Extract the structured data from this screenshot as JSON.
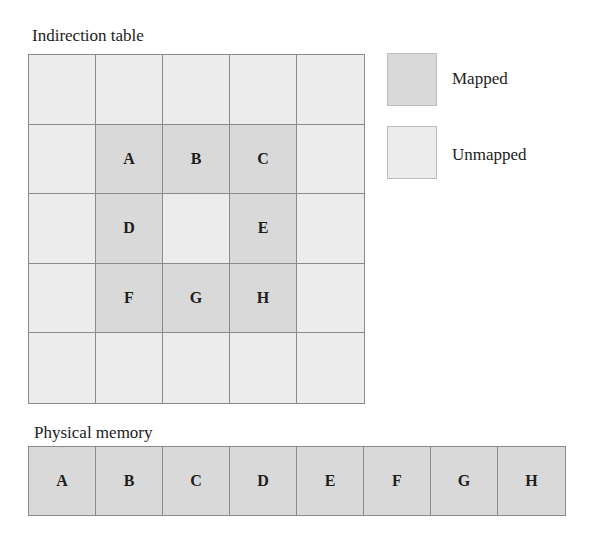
{
  "indirection_table": {
    "title": "Indirection table",
    "rows": 5,
    "cols": 5,
    "cells": [
      [
        {
          "label": "",
          "state": "unmapped"
        },
        {
          "label": "",
          "state": "unmapped"
        },
        {
          "label": "",
          "state": "unmapped"
        },
        {
          "label": "",
          "state": "unmapped"
        },
        {
          "label": "",
          "state": "unmapped"
        }
      ],
      [
        {
          "label": "",
          "state": "unmapped"
        },
        {
          "label": "A",
          "state": "mapped"
        },
        {
          "label": "B",
          "state": "mapped"
        },
        {
          "label": "C",
          "state": "mapped"
        },
        {
          "label": "",
          "state": "unmapped"
        }
      ],
      [
        {
          "label": "",
          "state": "unmapped"
        },
        {
          "label": "D",
          "state": "mapped"
        },
        {
          "label": "",
          "state": "unmapped"
        },
        {
          "label": "E",
          "state": "mapped"
        },
        {
          "label": "",
          "state": "unmapped"
        }
      ],
      [
        {
          "label": "",
          "state": "unmapped"
        },
        {
          "label": "F",
          "state": "mapped"
        },
        {
          "label": "G",
          "state": "mapped"
        },
        {
          "label": "H",
          "state": "mapped"
        },
        {
          "label": "",
          "state": "unmapped"
        }
      ],
      [
        {
          "label": "",
          "state": "unmapped"
        },
        {
          "label": "",
          "state": "unmapped"
        },
        {
          "label": "",
          "state": "unmapped"
        },
        {
          "label": "",
          "state": "unmapped"
        },
        {
          "label": "",
          "state": "unmapped"
        }
      ]
    ]
  },
  "legend": {
    "mapped": {
      "label": "Mapped",
      "color": "#d9d9d9"
    },
    "unmapped": {
      "label": "Unmapped",
      "color": "#ececec"
    }
  },
  "physical_memory": {
    "title": "Physical memory",
    "blocks": [
      "A",
      "B",
      "C",
      "D",
      "E",
      "F",
      "G",
      "H"
    ]
  }
}
